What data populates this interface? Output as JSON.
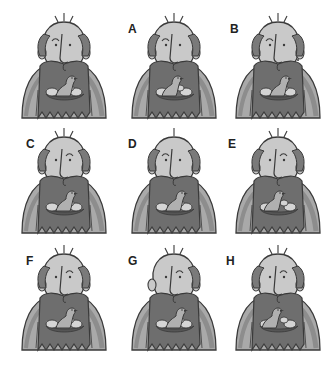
{
  "puzzle": {
    "type": "find-the-match",
    "subject": "bald bearded man with a bird and eggs in a nest in his beard",
    "original": {
      "label": ""
    },
    "options": [
      {
        "label": "A",
        "variant": "a"
      },
      {
        "label": "B",
        "variant": "b"
      },
      {
        "label": "C",
        "variant": "c"
      },
      {
        "label": "D",
        "variant": "d"
      },
      {
        "label": "E",
        "variant": "e"
      },
      {
        "label": "F",
        "variant": "f"
      },
      {
        "label": "G",
        "variant": "g"
      },
      {
        "label": "H",
        "variant": "h"
      }
    ]
  },
  "colors": {
    "background": "#ffffff",
    "outline": "#3a3a3a",
    "skin": "#c9c9c9",
    "hair": "#7a7a7a",
    "beard": "#6e6e6e",
    "coat": "#a9a9a9",
    "coat_shade": "#8d8d8d",
    "bird": "#b0b0b0",
    "egg": "#d4d4d4",
    "label": "#222222"
  }
}
